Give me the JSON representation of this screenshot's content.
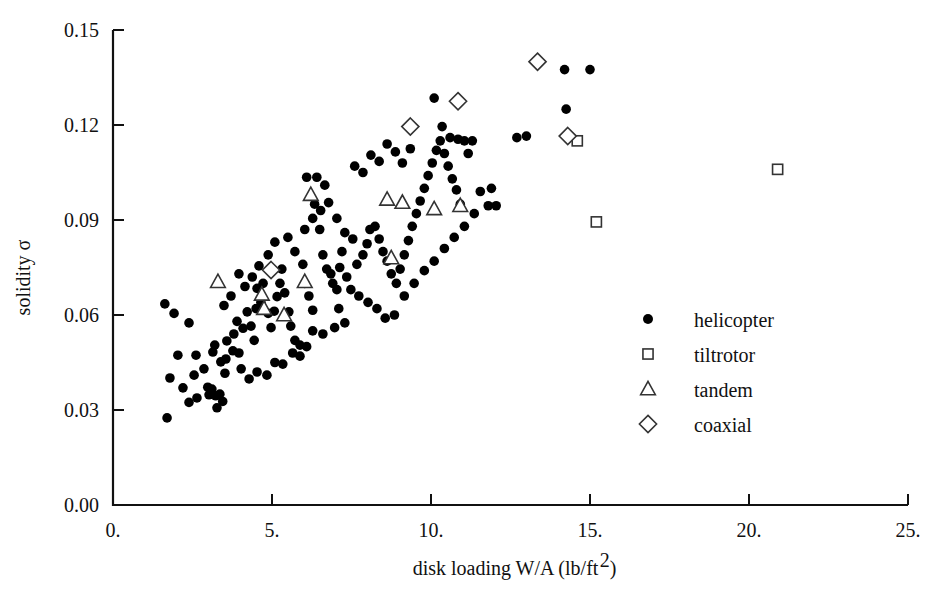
{
  "chart_data": {
    "type": "scatter",
    "title": "",
    "xlabel": "disk loading W/A (lb/ft2)",
    "xlabel_main": "disk loading W/A (lb/ft",
    "xlabel_sup": "2",
    "xlabel_tail": ")",
    "ylabel": "solidity σ",
    "ylabel_text": "solidity",
    "ylabel_symbol": "σ",
    "xlim": [
      0,
      25
    ],
    "ylim": [
      0.0,
      0.15
    ],
    "xticks": [
      0,
      5,
      10,
      15,
      20,
      25
    ],
    "xtick_labels": [
      "0.",
      "5.",
      "10.",
      "15.",
      "20.",
      "25."
    ],
    "yticks": [
      0.0,
      0.03,
      0.06,
      0.09,
      0.12,
      0.15
    ],
    "ytick_labels": [
      "0.00",
      "0.03",
      "0.06",
      "0.09",
      "0.12",
      "0.15"
    ],
    "grid": false,
    "legend_position": "center-right",
    "legend": [
      {
        "marker": "filled-circle",
        "label": "helicopter"
      },
      {
        "marker": "open-square",
        "label": "tiltrotor"
      },
      {
        "marker": "open-triangle",
        "label": "tandem"
      },
      {
        "marker": "open-diamond",
        "label": "coaxial"
      }
    ],
    "series": [
      {
        "name": "helicopter",
        "marker": "filled-circle",
        "points": [
          [
            1.7,
            0.0275
          ],
          [
            1.63,
            0.0635
          ],
          [
            1.92,
            0.0605
          ],
          [
            2.39,
            0.0575
          ],
          [
            2.04,
            0.0473
          ],
          [
            2.61,
            0.0473
          ],
          [
            3.14,
            0.0483
          ],
          [
            1.79,
            0.0401
          ],
          [
            2.64,
            0.0338
          ],
          [
            3.02,
            0.0348
          ],
          [
            3.23,
            0.0345
          ],
          [
            3.36,
            0.035
          ],
          [
            3.27,
            0.0307
          ],
          [
            3.11,
            0.0366
          ],
          [
            2.98,
            0.0372
          ],
          [
            3.45,
            0.0327
          ],
          [
            2.39,
            0.0324
          ],
          [
            3.52,
            0.0416
          ],
          [
            2.86,
            0.043
          ],
          [
            3.39,
            0.0452
          ],
          [
            3.55,
            0.0461
          ],
          [
            3.2,
            0.0505
          ],
          [
            3.58,
            0.0518
          ],
          [
            3.77,
            0.0487
          ],
          [
            3.8,
            0.054
          ],
          [
            3.96,
            0.048
          ],
          [
            4.03,
            0.043
          ],
          [
            4.28,
            0.0398
          ],
          [
            4.09,
            0.0558
          ],
          [
            4.34,
            0.0565
          ],
          [
            4.44,
            0.052
          ],
          [
            4.5,
            0.062
          ],
          [
            4.65,
            0.064
          ],
          [
            4.53,
            0.0684
          ],
          [
            4.72,
            0.07
          ],
          [
            4.88,
            0.0605
          ],
          [
            4.97,
            0.056
          ],
          [
            5.07,
            0.0612
          ],
          [
            5.16,
            0.0658
          ],
          [
            5.25,
            0.07
          ],
          [
            5.31,
            0.0745
          ],
          [
            5.4,
            0.067
          ],
          [
            5.53,
            0.061
          ],
          [
            5.59,
            0.0565
          ],
          [
            5.72,
            0.052
          ],
          [
            5.88,
            0.047
          ],
          [
            5.5,
            0.0845
          ],
          [
            5.72,
            0.08
          ],
          [
            5.97,
            0.076
          ],
          [
            6.03,
            0.07
          ],
          [
            6.16,
            0.066
          ],
          [
            6.28,
            0.0615
          ],
          [
            6.09,
            0.1035
          ],
          [
            6.41,
            0.1035
          ],
          [
            6.66,
            0.101
          ],
          [
            6.34,
            0.095
          ],
          [
            6.5,
            0.087
          ],
          [
            6.6,
            0.079
          ],
          [
            6.72,
            0.0745
          ],
          [
            6.85,
            0.073
          ],
          [
            6.91,
            0.07
          ],
          [
            7.04,
            0.068
          ],
          [
            7.13,
            0.075
          ],
          [
            7.2,
            0.08
          ],
          [
            7.35,
            0.072
          ],
          [
            7.48,
            0.068
          ],
          [
            7.1,
            0.062
          ],
          [
            7.29,
            0.0575
          ],
          [
            6.97,
            0.056
          ],
          [
            6.6,
            0.054
          ],
          [
            6.28,
            0.055
          ],
          [
            6.09,
            0.05
          ],
          [
            5.88,
            0.0505
          ],
          [
            5.65,
            0.048
          ],
          [
            5.34,
            0.0445
          ],
          [
            5.09,
            0.045
          ],
          [
            4.84,
            0.041
          ],
          [
            4.53,
            0.042
          ],
          [
            7.67,
            0.076
          ],
          [
            7.86,
            0.079
          ],
          [
            7.99,
            0.0825
          ],
          [
            8.08,
            0.087
          ],
          [
            8.24,
            0.088
          ],
          [
            8.37,
            0.084
          ],
          [
            8.49,
            0.08
          ],
          [
            8.62,
            0.077
          ],
          [
            8.75,
            0.073
          ],
          [
            8.91,
            0.07
          ],
          [
            9.03,
            0.0745
          ],
          [
            9.16,
            0.079
          ],
          [
            9.29,
            0.0835
          ],
          [
            9.41,
            0.088
          ],
          [
            9.54,
            0.092
          ],
          [
            9.66,
            0.096
          ],
          [
            9.79,
            0.1
          ],
          [
            9.91,
            0.104
          ],
          [
            10.04,
            0.108
          ],
          [
            10.17,
            0.112
          ],
          [
            10.29,
            0.115
          ],
          [
            10.42,
            0.111
          ],
          [
            10.54,
            0.107
          ],
          [
            10.67,
            0.103
          ],
          [
            10.8,
            0.0995
          ],
          [
            10.92,
            0.095
          ],
          [
            11.05,
            0.115
          ],
          [
            11.17,
            0.111
          ],
          [
            9.35,
            0.1125
          ],
          [
            9.1,
            0.108
          ],
          [
            8.88,
            0.1115
          ],
          [
            8.62,
            0.114
          ],
          [
            8.37,
            0.1085
          ],
          [
            8.11,
            0.1105
          ],
          [
            7.86,
            0.105
          ],
          [
            7.6,
            0.107
          ],
          [
            10.1,
            0.1285
          ],
          [
            10.35,
            0.1195
          ],
          [
            10.6,
            0.116
          ],
          [
            10.85,
            0.1155
          ],
          [
            11.3,
            0.115
          ],
          [
            11.8,
            0.0945
          ],
          [
            14.2,
            0.1375
          ],
          [
            15.0,
            0.1375
          ],
          [
            14.25,
            0.125
          ],
          [
            5.09,
            0.083
          ],
          [
            4.88,
            0.079
          ],
          [
            4.59,
            0.0755
          ],
          [
            4.38,
            0.072
          ],
          [
            4.15,
            0.069
          ],
          [
            3.96,
            0.073
          ],
          [
            3.71,
            0.066
          ],
          [
            3.49,
            0.063
          ],
          [
            7.73,
            0.066
          ],
          [
            8.02,
            0.064
          ],
          [
            8.3,
            0.062
          ],
          [
            8.56,
            0.059
          ],
          [
            8.85,
            0.06
          ],
          [
            9.16,
            0.066
          ],
          [
            9.47,
            0.07
          ],
          [
            9.79,
            0.074
          ],
          [
            10.1,
            0.077
          ],
          [
            10.42,
            0.081
          ],
          [
            10.73,
            0.0845
          ],
          [
            11.05,
            0.088
          ],
          [
            11.36,
            0.092
          ],
          [
            6.03,
            0.087
          ],
          [
            6.28,
            0.0905
          ],
          [
            6.53,
            0.093
          ],
          [
            6.78,
            0.0955
          ],
          [
            7.04,
            0.0905
          ],
          [
            7.29,
            0.086
          ],
          [
            7.54,
            0.084
          ],
          [
            12.7,
            0.116
          ],
          [
            13.0,
            0.1165
          ],
          [
            2.2,
            0.037
          ],
          [
            2.55,
            0.041
          ],
          [
            4.97,
            0.0745
          ],
          [
            4.22,
            0.061
          ],
          [
            3.9,
            0.058
          ],
          [
            11.55,
            0.099
          ],
          [
            11.9,
            0.1
          ],
          [
            12.05,
            0.0945
          ]
        ]
      },
      {
        "name": "tiltrotor",
        "marker": "open-square",
        "points": [
          [
            14.6,
            0.115
          ],
          [
            15.2,
            0.0894
          ],
          [
            20.9,
            0.106
          ]
        ]
      },
      {
        "name": "tandem",
        "marker": "open-triangle",
        "points": [
          [
            3.3,
            0.0705
          ],
          [
            4.68,
            0.0665
          ],
          [
            4.75,
            0.062
          ],
          [
            5.38,
            0.06
          ],
          [
            6.22,
            0.098
          ],
          [
            6.03,
            0.0705
          ],
          [
            8.62,
            0.0965
          ],
          [
            8.75,
            0.078
          ],
          [
            9.1,
            0.0955
          ],
          [
            10.1,
            0.0935
          ],
          [
            10.92,
            0.0945
          ]
        ]
      },
      {
        "name": "coaxial",
        "marker": "open-diamond",
        "points": [
          [
            4.97,
            0.0742
          ],
          [
            9.35,
            0.1195
          ],
          [
            10.85,
            0.1275
          ],
          [
            13.35,
            0.14
          ],
          [
            14.3,
            0.1165
          ]
        ]
      }
    ]
  }
}
